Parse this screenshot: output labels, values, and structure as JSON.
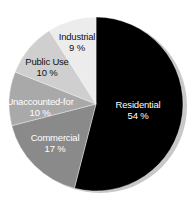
{
  "chart_data": {
    "type": "pie",
    "title": "",
    "start_angle_deg": 0,
    "direction": "clockwise",
    "legend": "none (labels inside slices)",
    "slices": [
      {
        "label": "Residential",
        "value": 54,
        "display": "54 %",
        "color": "#000000",
        "text_color": "#ffffff",
        "label_x": 138,
        "label_y": 108
      },
      {
        "label": "Commercial",
        "value": 17,
        "display": "17 %",
        "color": "#8a8a8a",
        "text_color": "#ffffff",
        "label_x": 55,
        "label_y": 141
      },
      {
        "label": "Unaccounted-for",
        "value": 10,
        "display": "10 %",
        "color": "#a9a9a9",
        "text_color": "#ffffff",
        "label_x": 40,
        "label_y": 105
      },
      {
        "label": "Public Use",
        "value": 10,
        "display": "10 %",
        "color": "#cfcfcf",
        "text_color": "#111111",
        "label_x": 47,
        "label_y": 65
      },
      {
        "label": "Industrial",
        "value": 9,
        "display": "9 %",
        "color": "#ececec",
        "text_color": "#111111",
        "label_x": 77,
        "label_y": 40
      }
    ]
  },
  "geometry": {
    "cx": 96,
    "cy": 104,
    "r": 87,
    "shadow_color": "#c8c8c8"
  }
}
